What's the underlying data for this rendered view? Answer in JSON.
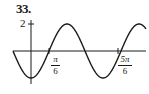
{
  "problem_number": "33.",
  "chart_data": {
    "type": "line",
    "title": "",
    "function": "y = -2cos(3x)",
    "xlabel": "",
    "ylabel": "",
    "y_tick_labels": [
      "2"
    ],
    "x_tick_labels": [
      "π/6",
      "5π/6"
    ],
    "amplitude": 2,
    "period": "2π/3",
    "x": [
      "-π/6",
      "0",
      "π/6",
      "π/3",
      "π/2",
      "2π/3",
      "5π/6",
      "π"
    ],
    "values": [
      0,
      -2,
      0,
      2,
      0,
      -2,
      0,
      2
    ],
    "grid": false,
    "legend": null
  },
  "labels": {
    "y_tick": "2",
    "x_tick_1_num": "π",
    "x_tick_1_den": "6",
    "x_tick_2_num": "5π",
    "x_tick_2_den": "6"
  },
  "colors": {
    "ink": "#1a1a1a",
    "background": "#ffffff"
  }
}
